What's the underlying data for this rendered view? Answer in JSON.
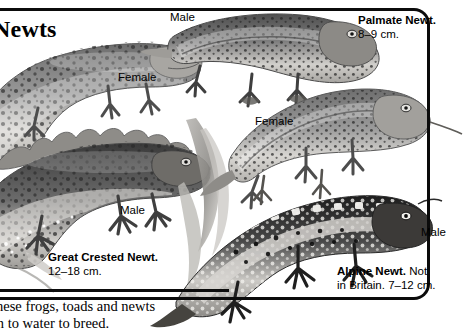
{
  "page": {
    "title": "Newts",
    "title_clipped": true,
    "background": "#ffffff",
    "ink": "#0b0b0b"
  },
  "species": [
    {
      "id": "great-crested-newt",
      "name": "Great Crested Newt.",
      "size": "12–18 cm.",
      "note": ""
    },
    {
      "id": "palmate-newt",
      "name": "Palmate Newt.",
      "size": "8–9 cm.",
      "note": ""
    },
    {
      "id": "alpine-newt",
      "name": "Alpine Newt.",
      "size": "7–12 cm.",
      "note": "Not in Britain."
    }
  ],
  "captions": {
    "palmate": {
      "name": "Palmate Newt.",
      "size": "8–9 cm."
    },
    "great_crested": {
      "name": "Great Crested Newt.",
      "size": "12–18 cm."
    },
    "alpine": {
      "name": "Alpine Newt.",
      "rest": "Not",
      "line2": "in Britain. 7–12 cm."
    }
  },
  "sex_labels": {
    "smooth_male": "Male",
    "smooth_female": "Female",
    "palmate_female": "Female",
    "crested_male": "Male",
    "alpine_male": "Male"
  },
  "footer": {
    "line1": "these frogs, toads and newts",
    "line2": "rn to water to breed."
  },
  "figures": [
    {
      "id": "smooth-newt-female",
      "label": "Female",
      "species": "Smooth Newt"
    },
    {
      "id": "smooth-newt-male",
      "label": "Male",
      "species": "Smooth Newt"
    },
    {
      "id": "great-crested-newt-male",
      "label": "Male",
      "species": "Great Crested Newt"
    },
    {
      "id": "palmate-newt-male",
      "label": "Male",
      "species": "Palmate Newt"
    },
    {
      "id": "palmate-newt-female",
      "label": "Female",
      "species": "Palmate Newt"
    },
    {
      "id": "alpine-newt-male",
      "label": "Male",
      "species": "Alpine Newt"
    }
  ]
}
